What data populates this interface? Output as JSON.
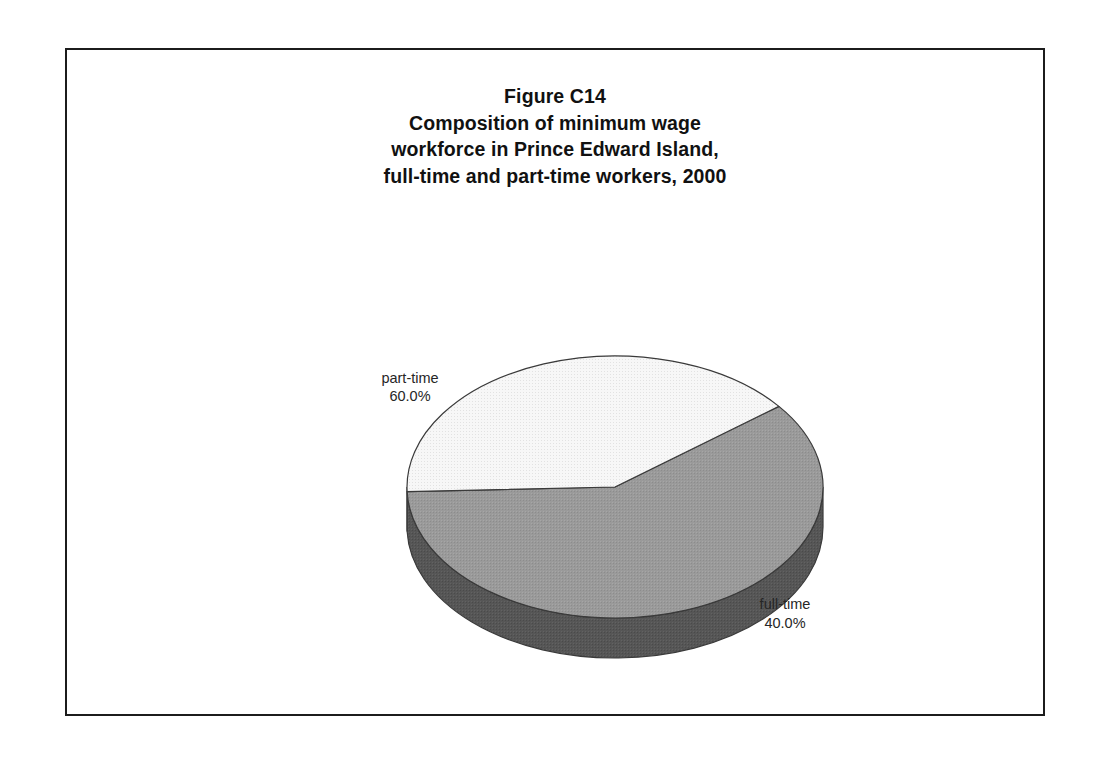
{
  "figure": {
    "title_lines": [
      "Figure C14",
      "Composition of minimum wage",
      "workforce in Prince Edward Island,",
      "full-time and part-time workers, 2000"
    ],
    "border_color": "#1c1c1c",
    "background_color": "#ffffff"
  },
  "chart_data": {
    "type": "pie",
    "title": "Figure C14 Composition of minimum wage workforce in Prince Edward Island, full-time and part-time workers, 2000",
    "xlabel": "",
    "ylabel": "",
    "legend_position": "none",
    "grid": false,
    "three_d": true,
    "categories": [
      "part-time",
      "full-time"
    ],
    "values": [
      60.0,
      40.0
    ],
    "value_labels": [
      "60.0%",
      "40.0%"
    ],
    "slices": [
      {
        "name": "part-time",
        "label": "part-time",
        "value_label": "60.0%",
        "value": 60.0,
        "top_color": "#9a9a9a",
        "side_color": "#565656",
        "label_x": 343,
        "label_y": 333,
        "label_value_y": 351
      },
      {
        "name": "full-time",
        "label": "full-time",
        "value_label": "40.0%",
        "value": 40.0,
        "top_color": "#f4f4f4",
        "side_color": "#6a6a6a",
        "label_x": 718,
        "label_y": 559,
        "label_value_y": 578
      }
    ],
    "geometry": {
      "center_x": 548,
      "center_y": 437,
      "radius_x": 208,
      "radius_y": 131,
      "depth": 40,
      "start_angle_deg": 322
    }
  }
}
